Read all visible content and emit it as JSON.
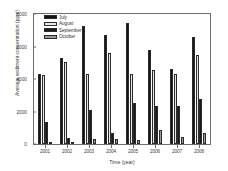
{
  "chart_data": {
    "type": "bar",
    "title": "",
    "xlabel": "Time (year)",
    "ylabel": "Average sediment concentration (ppm)",
    "categories": [
      "2001",
      "2002",
      "2003",
      "2004",
      "2005",
      "2006",
      "2007",
      "2008"
    ],
    "ylim": [
      0,
      8000
    ],
    "yticks": [
      0,
      2000,
      4000,
      6000,
      8000
    ],
    "ytick_labels": [
      "0",
      "2000",
      "4000",
      "6000",
      "8000"
    ],
    "grid": false,
    "legend_position": "top-left",
    "series": [
      {
        "name": "July",
        "color": "#141414",
        "values": [
          4280,
          5320,
          7280,
          6720,
          7420,
          5800,
          4620,
          6600
        ]
      },
      {
        "name": "August",
        "color": "#e9e9e9",
        "values": [
          4230,
          5020,
          4300,
          5620,
          4300,
          4560,
          4320,
          5480
        ]
      },
      {
        "name": "September",
        "color": "#1a1a1a",
        "values": [
          1380,
          360,
          2120,
          700,
          2520,
          2320,
          2360,
          2780
        ]
      },
      {
        "name": "October",
        "color": "#9a9a9a",
        "values": [
          110,
          70,
          330,
          290,
          250,
          840,
          450,
          700
        ]
      }
    ]
  }
}
